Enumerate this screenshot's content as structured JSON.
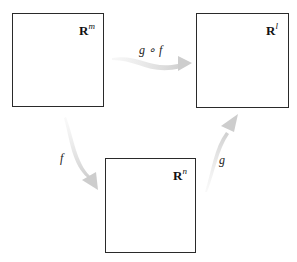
{
  "diagram": {
    "type": "commutative-function-composition",
    "spaces": [
      {
        "id": "Rm",
        "base": "R",
        "exponent": "m",
        "position": "top-left"
      },
      {
        "id": "Rl",
        "base": "R",
        "exponent": "l",
        "position": "top-right"
      },
      {
        "id": "Rn",
        "base": "R",
        "exponent": "n",
        "position": "bottom-center"
      }
    ],
    "maps": [
      {
        "label": "f",
        "from": "Rm",
        "to": "Rn"
      },
      {
        "label": "g",
        "from": "Rn",
        "to": "Rl"
      },
      {
        "label": "g ∘ f",
        "from": "Rm",
        "to": "Rl"
      }
    ],
    "colors": {
      "box_border": "#2a2a2a",
      "arrow": "#d4d4d4",
      "text": "#111111"
    }
  }
}
